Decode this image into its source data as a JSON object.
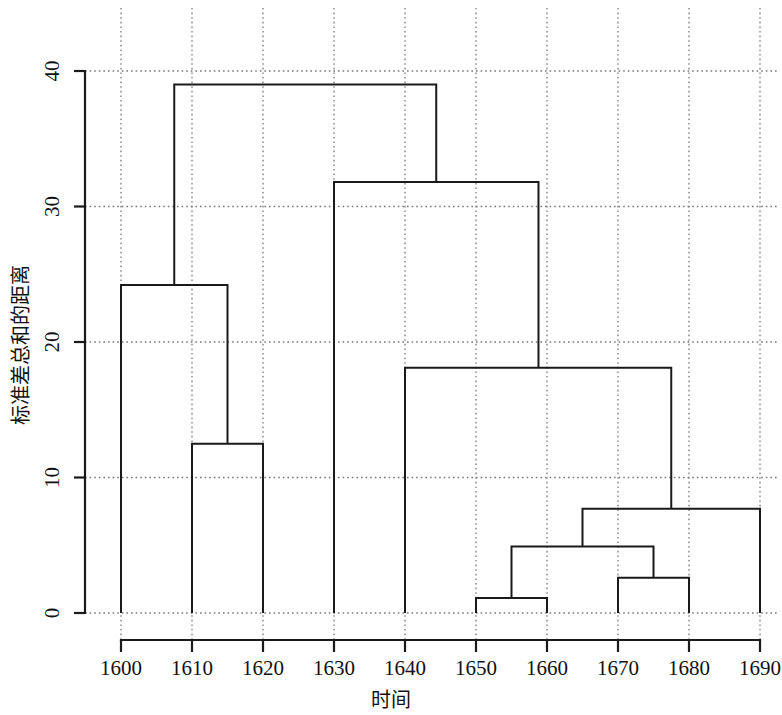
{
  "chart_data": {
    "type": "dendrogram",
    "title": "",
    "subtitle": "",
    "xlabel": "时间",
    "ylabel": "标准差总和的距离",
    "xlim": [
      1595,
      1695
    ],
    "ylim": [
      0,
      42
    ],
    "x_ticks": [
      1600,
      1610,
      1620,
      1630,
      1640,
      1650,
      1660,
      1670,
      1680,
      1690
    ],
    "x_tick_labels": [
      "1600",
      "1610",
      "1620",
      "1630",
      "1640",
      "1650",
      "1660",
      "1670",
      "1680",
      "1690"
    ],
    "y_ticks": [
      0,
      10,
      20,
      30,
      40
    ],
    "y_tick_labels": [
      "0",
      "10",
      "20",
      "30",
      "40"
    ],
    "grid": "both-dotted",
    "legend": "none",
    "leaves": [
      {
        "id": "L1600",
        "x": 1600,
        "label": "1600"
      },
      {
        "id": "L1610",
        "x": 1610,
        "label": "1610"
      },
      {
        "id": "L1620",
        "x": 1620,
        "label": "1620"
      },
      {
        "id": "L1630",
        "x": 1630,
        "label": "1630"
      },
      {
        "id": "L1640",
        "x": 1640,
        "label": "1640"
      },
      {
        "id": "L1650",
        "x": 1650,
        "label": "1650"
      },
      {
        "id": "L1660",
        "x": 1660,
        "label": "1660"
      },
      {
        "id": "L1670",
        "x": 1670,
        "label": "1670"
      },
      {
        "id": "L1680",
        "x": 1680,
        "label": "1680"
      },
      {
        "id": "L1690",
        "x": 1690,
        "label": "1690"
      }
    ],
    "merges": [
      {
        "id": "M1",
        "left": "L1650",
        "right": "L1660",
        "height": 1.1,
        "x": 1655.0
      },
      {
        "id": "M2",
        "left": "L1670",
        "right": "L1680",
        "height": 2.6,
        "x": 1675.0
      },
      {
        "id": "M3",
        "left": "M1",
        "right": "M2",
        "height": 4.9,
        "x": 1665.0
      },
      {
        "id": "M4",
        "left": "M3",
        "right": "L1690",
        "height": 7.7,
        "x": 1677.5
      },
      {
        "id": "M5",
        "left": "L1610",
        "right": "L1620",
        "height": 12.5,
        "x": 1615.0
      },
      {
        "id": "M6",
        "left": "L1640",
        "right": "M4",
        "height": 18.1,
        "x": 1658.8
      },
      {
        "id": "M7",
        "left": "L1600",
        "right": "M5",
        "height": 24.2,
        "x": 1607.5
      },
      {
        "id": "M8",
        "left": "L1630",
        "right": "M6",
        "height": 31.8,
        "x": 1644.4
      },
      {
        "id": "M9",
        "left": "M7",
        "right": "M8",
        "height": 39.0,
        "x": 1626.0
      }
    ],
    "line_color": "#1a1a1a",
    "grid_color": "#7a7a7a",
    "background_color": "#ffffff"
  },
  "axes": {
    "x_axis_name": "time-axis",
    "y_axis_name": "distance-axis"
  }
}
